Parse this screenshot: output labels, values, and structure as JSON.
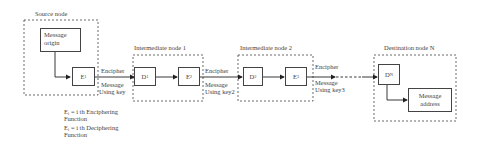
{
  "nodes": {
    "source": {
      "title": "Source node",
      "origin": "Message origin",
      "enc": {
        "letter": "E",
        "sub": "1"
      }
    },
    "intermediate1": {
      "title": "Intermediate node 1",
      "dec": {
        "letter": "D",
        "sub": "1"
      },
      "enc": {
        "letter": "E",
        "sub": "2"
      }
    },
    "intermediate2": {
      "title": "Intermediate node 2",
      "dec": {
        "letter": "D",
        "sub": "2"
      },
      "enc": {
        "letter": "E",
        "sub": "3"
      }
    },
    "destination": {
      "title": "Destination node N",
      "dec": {
        "letter": "D",
        "sub": "N"
      },
      "address": "Message address"
    }
  },
  "links": [
    {
      "top": "Encipher",
      "bottom1": "Message",
      "bottom2": "Using key"
    },
    {
      "top": "Encipher",
      "bottom1": "Message",
      "bottom2": "Using key2"
    },
    {
      "top": "Encipher",
      "bottom1": "Message",
      "bottom2": "Using key3"
    }
  ],
  "legend": [
    {
      "sym": "E",
      "sub": "i",
      "text1": " = i th Enciphering",
      "text2": "Function"
    },
    {
      "sym": "E",
      "sub": "i",
      "text1": " = i th Deciphering",
      "text2": "Function"
    }
  ],
  "colors": {
    "line": "#444444",
    "background": "#ffffff"
  }
}
